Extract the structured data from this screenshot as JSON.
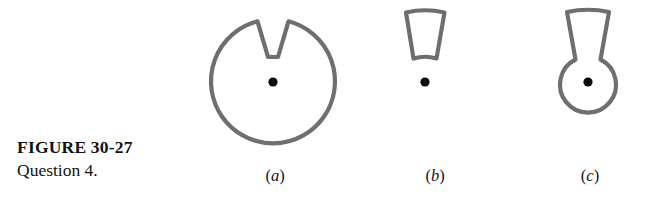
{
  "figure": {
    "caption_title": "FIGURE 30-27",
    "caption_subtitle": "Question 4.",
    "stroke_color": "#6e6e6e",
    "dot_color": "#0a0a0a",
    "background": "#ffffff",
    "panels": [
      {
        "id": "a",
        "label_open": "(",
        "label_letter": "a",
        "label_close": ")",
        "shape": "circle-with-v-notch",
        "description": "Large circle with a V-shaped wedge notch removed from the top, point charge dot at center",
        "center": [
          93,
          82
        ],
        "radius": 62,
        "dot_radius": 4.5
      },
      {
        "id": "b",
        "label_open": "(",
        "label_letter": "b",
        "label_close": ")",
        "shape": "wedge-trapezoid",
        "description": "Isolated wedge (trapezoid, wide at top, narrow at bottom) with point charge dot below it",
        "dot_center": [
          45,
          82
        ],
        "dot_radius": 4.5
      },
      {
        "id": "c",
        "label_open": "(",
        "label_letter": "c",
        "label_close": ")",
        "shape": "circle-with-funnel-spout",
        "description": "Small circle with a flaring funnel / spout extending from the top, point charge dot at circle center",
        "center": [
          58,
          82
        ],
        "radius": 28,
        "dot_radius": 4.5
      }
    ]
  }
}
